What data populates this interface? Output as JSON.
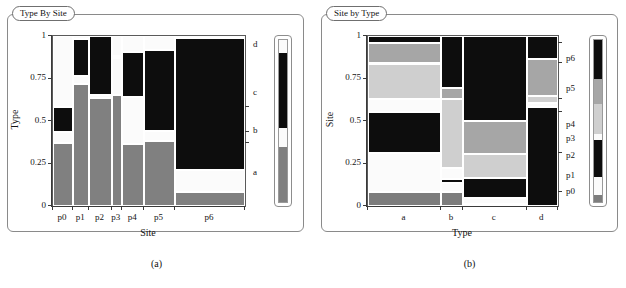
{
  "figure": {
    "panels": [
      {
        "id": "a",
        "caption": "(a)",
        "title": "Type By Site",
        "xlabel": "Site",
        "ylabel": "Type",
        "ytick_labels": [
          "1",
          "0.75",
          "0.5",
          "0.25",
          "0"
        ],
        "ytick_values": [
          1,
          0.75,
          0.5,
          0.25,
          0
        ],
        "xtick_labels": [
          "p0",
          "p1",
          "p2",
          "p3",
          "p4",
          "p5",
          "p6"
        ],
        "right_labels": [
          "d",
          "c",
          "b",
          "a"
        ],
        "legend_name": "type-colorbar"
      },
      {
        "id": "b",
        "caption": "(b)",
        "title": "Site by Type",
        "xlabel": "Type",
        "ylabel": "Site",
        "ytick_labels": [
          "1",
          "0.75",
          "0.5",
          "0.25",
          "0"
        ],
        "ytick_values": [
          1,
          0.75,
          0.5,
          0.25,
          0
        ],
        "xtick_labels": [
          "a",
          "b",
          "c",
          "d"
        ],
        "right_labels": [
          "p6",
          "p5",
          "p4",
          "p3",
          "p2",
          "p1",
          "p0"
        ],
        "legend_name": "site-colorbar"
      }
    ]
  },
  "colors": {
    "a_black": "#0d0d0d",
    "a_white": "#fbfbfb",
    "a_gray": "#808080",
    "p_black": "#0d0d0d",
    "p_medgray": "#a6a6a6",
    "p_lightgray": "#cfcfcf",
    "p_white": "#fbfbfb",
    "p_darkgray": "#7d7d7d",
    "axis": "#3a3a3a",
    "frame": "#8a8a8a",
    "text": "#141414"
  },
  "chart_data": [
    {
      "type": "bar",
      "subtype": "mosaic",
      "title": "Type By Site",
      "xlabel": "Site",
      "ylabel": "Type",
      "ylim": [
        0,
        1
      ],
      "grid": false,
      "legend_position": "right",
      "categories": [
        "p0",
        "p1",
        "p2",
        "p3",
        "p4",
        "p5",
        "p6"
      ],
      "category_widths": [
        0.105,
        0.085,
        0.115,
        0.055,
        0.115,
        0.16,
        0.365
      ],
      "series": [
        {
          "name": "a",
          "color": "#808080",
          "values": [
            0.37,
            0.72,
            0.635,
            0.655,
            0.365,
            0.385,
            0.08
          ]
        },
        {
          "name": "b",
          "color": "#fbfbfb",
          "values": [
            0.065,
            0.045,
            0.02,
            0.215,
            0.275,
            0.055,
            0.13
          ]
        },
        {
          "name": "c",
          "color": "#0d0d0d",
          "values": [
            0.145,
            0.215,
            0.345,
            0.015,
            0.265,
            0.48,
            0.78
          ]
        },
        {
          "name": "d",
          "color": "#fbfbfb",
          "values": [
            0.42,
            0.02,
            0.0,
            0.115,
            0.095,
            0.08,
            0.01
          ]
        }
      ],
      "right_axis_labels": [
        "d",
        "c",
        "b",
        "a"
      ],
      "right_axis_positions": [
        0.945,
        0.665,
        0.44,
        0.195
      ],
      "notes": "Mosaic/spineplot of Type conditional on Site; column widths proportional to site counts."
    },
    {
      "type": "bar",
      "subtype": "mosaic",
      "title": "Site by Type",
      "xlabel": "Type",
      "ylabel": "Site",
      "ylim": [
        0,
        1
      ],
      "grid": false,
      "legend_position": "right",
      "categories": [
        "a",
        "b",
        "c",
        "d"
      ],
      "category_widths": [
        0.385,
        0.115,
        0.335,
        0.165
      ],
      "series": [
        {
          "name": "p0",
          "color": "#7d7d7d",
          "values": [
            0.08,
            0.08,
            0.01,
            0.0
          ]
        },
        {
          "name": "p1",
          "color": "#fbfbfb",
          "values": [
            0.23,
            0.055,
            0.035,
            0.0
          ]
        },
        {
          "name": "p2",
          "color": "#0d0d0d",
          "values": [
            0.235,
            0.025,
            0.12,
            0.535
          ]
        },
        {
          "name": "p3",
          "color": "#fbfbfb",
          "values": [
            0.08,
            0.06,
            0.0,
            0.02
          ]
        },
        {
          "name": "p4",
          "color": "#cfcfcf",
          "values": [
            0.205,
            0.405,
            0.14,
            0.035
          ]
        },
        {
          "name": "p5",
          "color": "#a6a6a6",
          "values": [
            0.12,
            0.065,
            0.19,
            0.2
          ]
        },
        {
          "name": "p6",
          "color": "#0d0d0d",
          "values": [
            0.04,
            0.3,
            0.495,
            0.125
          ]
        }
      ],
      "right_axis_labels": [
        "p6",
        "p5",
        "p4",
        "p3",
        "p2",
        "p1",
        "p0"
      ],
      "right_axis_positions": [
        0.865,
        0.69,
        0.475,
        0.395,
        0.295,
        0.175,
        0.085
      ],
      "notes": "Mosaic/spineplot of Site conditional on Type; column widths proportional to type counts."
    }
  ]
}
